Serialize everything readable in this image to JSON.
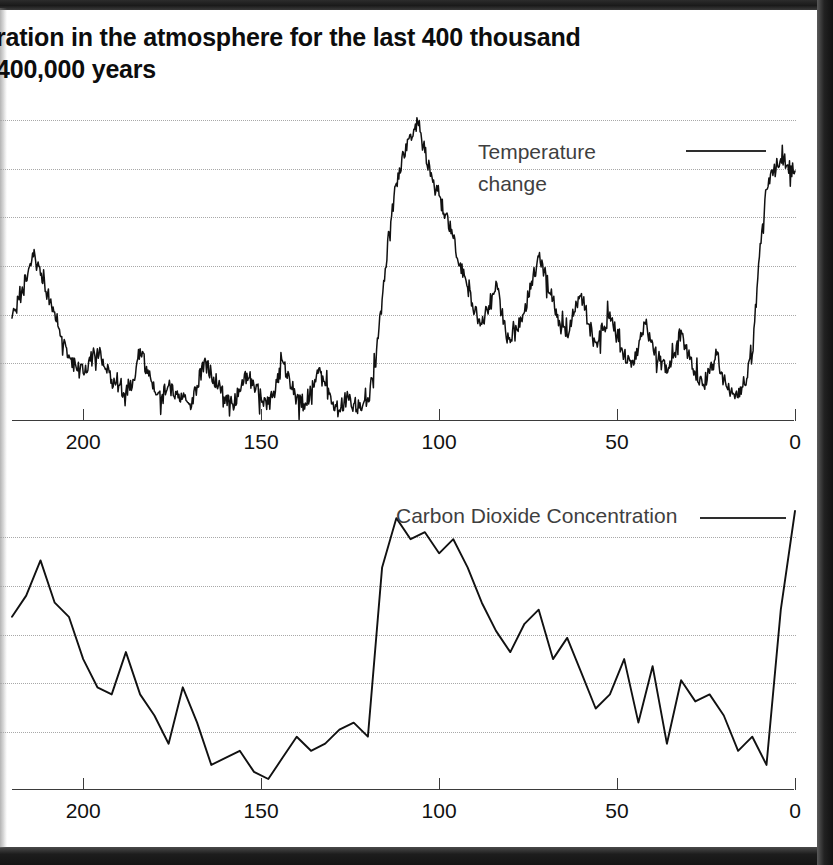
{
  "document": {
    "title_lines": [
      "ration in the atmosphere for the last 400 thousand",
      "400,000 years"
    ],
    "title_note": "left edge of title is cropped by the scan"
  },
  "charts": {
    "temperature": {
      "legend_label_line1": "Temperature",
      "legend_label_line2": "change",
      "legend_swatch": "solid-line",
      "axis_tick_labels": [
        "200",
        "150",
        "100",
        "50",
        "0"
      ]
    },
    "co2": {
      "legend_label": "Carbon Dioxide Concentration",
      "legend_swatch": "solid-line",
      "axis_tick_labels": [
        "200",
        "150",
        "100",
        "50",
        "0"
      ]
    }
  },
  "chart_data": [
    {
      "type": "line",
      "name": "temperature-change",
      "title": "Temperature change",
      "xlabel": "",
      "ylabel": "",
      "xlim": [
        220,
        0
      ],
      "xticks": [
        200,
        150,
        100,
        50,
        0
      ],
      "xtick_labels": [
        "200",
        "150",
        "100",
        "50",
        "0"
      ],
      "x_unit": "thousand years before present",
      "grid": "horizontal-dotted",
      "gridlines_count": 6,
      "legend_position": "upper-right",
      "series": [
        {
          "name": "Temperature change",
          "x": [
            220,
            218,
            216,
            214,
            212,
            210,
            208,
            206,
            204,
            202,
            200,
            198,
            196,
            194,
            192,
            190,
            188,
            186,
            184,
            182,
            180,
            178,
            176,
            174,
            172,
            170,
            168,
            166,
            164,
            162,
            160,
            158,
            156,
            154,
            152,
            150,
            148,
            146,
            144,
            142,
            140,
            138,
            136,
            134,
            132,
            130,
            128,
            126,
            124,
            122,
            120,
            118,
            116,
            114,
            112,
            110,
            108,
            106,
            104,
            102,
            100,
            98,
            96,
            94,
            92,
            90,
            88,
            86,
            84,
            82,
            80,
            78,
            76,
            74,
            72,
            70,
            68,
            66,
            64,
            62,
            60,
            58,
            56,
            54,
            52,
            50,
            48,
            46,
            44,
            42,
            40,
            38,
            36,
            34,
            32,
            30,
            28,
            26,
            24,
            22,
            20,
            18,
            16,
            14,
            12,
            10,
            8,
            6,
            4,
            2,
            0
          ],
          "values": [
            32,
            38,
            44,
            52,
            46,
            40,
            34,
            26,
            20,
            16,
            14,
            18,
            22,
            16,
            12,
            10,
            8,
            12,
            22,
            14,
            8,
            6,
            10,
            8,
            6,
            4,
            10,
            18,
            14,
            10,
            6,
            4,
            8,
            14,
            10,
            6,
            4,
            8,
            18,
            12,
            6,
            4,
            8,
            14,
            10,
            4,
            2,
            6,
            4,
            2,
            6,
            16,
            38,
            60,
            76,
            86,
            92,
            96,
            86,
            78,
            72,
            66,
            58,
            50,
            42,
            34,
            30,
            36,
            44,
            30,
            24,
            28,
            34,
            44,
            52,
            46,
            38,
            30,
            26,
            34,
            40,
            30,
            24,
            28,
            34,
            26,
            20,
            16,
            22,
            30,
            24,
            18,
            14,
            20,
            28,
            20,
            14,
            10,
            14,
            20,
            12,
            8,
            6,
            10,
            20,
            52,
            74,
            80,
            84,
            82,
            80
          ]
        }
      ]
    },
    {
      "type": "line",
      "name": "carbon-dioxide-concentration",
      "title": "Carbon Dioxide Concentration",
      "xlabel": "",
      "ylabel": "",
      "xlim": [
        220,
        0
      ],
      "xticks": [
        200,
        150,
        100,
        50,
        0
      ],
      "xtick_labels": [
        "200",
        "150",
        "100",
        "50",
        "0"
      ],
      "x_unit": "thousand years before present",
      "grid": "horizontal-dotted",
      "gridlines_count": 5,
      "legend_position": "upper-right",
      "series": [
        {
          "name": "Carbon Dioxide Concentration",
          "x": [
            220,
            216,
            212,
            208,
            204,
            200,
            196,
            192,
            188,
            184,
            180,
            176,
            172,
            168,
            164,
            160,
            156,
            152,
            148,
            144,
            140,
            136,
            132,
            128,
            124,
            120,
            116,
            112,
            108,
            104,
            100,
            96,
            92,
            88,
            84,
            80,
            76,
            72,
            68,
            64,
            60,
            56,
            52,
            48,
            44,
            40,
            36,
            32,
            28,
            24,
            20,
            16,
            12,
            8,
            4,
            0
          ],
          "values": [
            56,
            62,
            72,
            60,
            56,
            44,
            36,
            34,
            46,
            34,
            28,
            20,
            36,
            26,
            14,
            16,
            18,
            12,
            10,
            16,
            22,
            18,
            20,
            24,
            26,
            22,
            70,
            84,
            78,
            80,
            74,
            78,
            70,
            60,
            52,
            46,
            54,
            58,
            44,
            50,
            40,
            30,
            34,
            44,
            26,
            42,
            20,
            38,
            32,
            34,
            28,
            18,
            22,
            14,
            58,
            86
          ]
        }
      ]
    }
  ]
}
